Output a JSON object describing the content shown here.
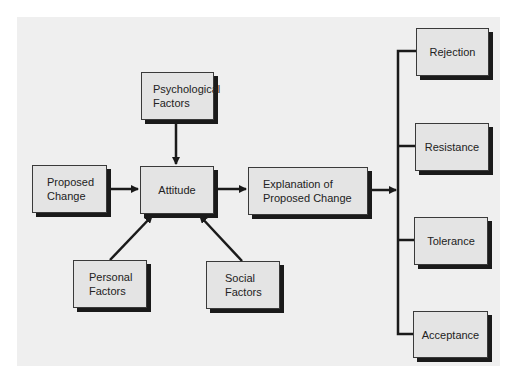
{
  "diagram": {
    "nodes": {
      "psychological": {
        "label": "Psychological\nFactors"
      },
      "proposed_change": {
        "label": "Proposed\nChange"
      },
      "attitude": {
        "label": "Attitude"
      },
      "explanation": {
        "label": "Explanation of\nProposed Change"
      },
      "personal": {
        "label": "Personal\nFactors"
      },
      "social": {
        "label": "Social\nFactors"
      },
      "rejection": {
        "label": "Rejection"
      },
      "resistance": {
        "label": "Resistance"
      },
      "tolerance": {
        "label": "Tolerance"
      },
      "acceptance": {
        "label": "Acceptance"
      }
    },
    "edges": [
      {
        "from": "psychological",
        "to": "attitude"
      },
      {
        "from": "proposed_change",
        "to": "attitude"
      },
      {
        "from": "personal",
        "to": "attitude"
      },
      {
        "from": "social",
        "to": "attitude"
      },
      {
        "from": "attitude",
        "to": "explanation"
      },
      {
        "from": "explanation",
        "to": [
          "rejection",
          "resistance",
          "tolerance",
          "acceptance"
        ]
      }
    ],
    "colors": {
      "panel": "#efefef",
      "box_fill": "#e4e4e4",
      "line": "#1a1a1a"
    }
  }
}
